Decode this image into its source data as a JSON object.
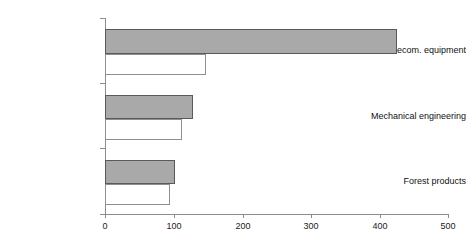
{
  "chart_data": {
    "type": "bar",
    "orientation": "horizontal",
    "title": "",
    "xlabel": "",
    "ylabel": "",
    "categories": [
      "Telecom. equipment",
      "Mechanical engineering",
      "Forest products"
    ],
    "series": [
      {
        "name": "series-1",
        "values": [
          425,
          128,
          102
        ],
        "color": "#a9a9a9"
      },
      {
        "name": "series-2",
        "values": [
          147,
          112,
          95
        ],
        "color": "#ffffff"
      }
    ],
    "xlim": [
      0,
      500
    ],
    "xticks": [
      0,
      100,
      200,
      300,
      400,
      500
    ],
    "xtick_labels": [
      "0",
      "100",
      "200",
      "300",
      "400",
      "500"
    ],
    "grid": false,
    "legend": "none"
  },
  "axis": {
    "tick_labels": [
      "0",
      "100",
      "200",
      "300",
      "400",
      "500"
    ],
    "max": 500
  },
  "categories": {
    "items": [
      {
        "label": "Telecom. equipment"
      },
      {
        "label": "Mechanical engineering"
      },
      {
        "label": "Forest products"
      }
    ]
  },
  "colors": {
    "primary_bar": "#a9a9a9",
    "primary_bar_border": "#5a5a5a",
    "secondary_bar": "#ffffff",
    "secondary_bar_border": "#8f8f8f",
    "axis": "#8c8c8c",
    "text": "#111111"
  }
}
